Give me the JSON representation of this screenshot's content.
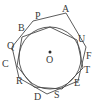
{
  "figure": {
    "type": "geometry-diagram",
    "background_color": "#ffffff",
    "stroke_color": "#4a4a4a",
    "label_color": "#3a3a3a",
    "center": {
      "label": "O",
      "dot": "center-dot",
      "x": 50,
      "y": 58
    },
    "circle": {
      "cx": 50,
      "cy": 58,
      "r": 31
    },
    "inner_polygon": {
      "name": "inscribed-heptagon",
      "points": "50,27 77,40 83,68 62,89 34,87 17,66 22,37"
    },
    "outer_polygon": {
      "name": "circumscribed-heptagon",
      "points": "66,13 86,47 78,81 47,94 19,78 12,47 33,21"
    },
    "labels": [
      {
        "text": "A",
        "x": 62,
        "y": 8
      },
      {
        "text": "P",
        "x": 35,
        "y": 14
      },
      {
        "text": "B",
        "x": 18,
        "y": 26
      },
      {
        "text": "U",
        "x": 78,
        "y": 37
      },
      {
        "text": "Q",
        "x": 8,
        "y": 43
      },
      {
        "text": "F",
        "x": 85,
        "y": 53
      },
      {
        "text": "C",
        "x": 3,
        "y": 61
      },
      {
        "text": "T",
        "x": 83,
        "y": 67
      },
      {
        "text": "R",
        "x": 16,
        "y": 78
      },
      {
        "text": "E",
        "x": 74,
        "y": 80
      },
      {
        "text": "S",
        "x": 54,
        "y": 91
      },
      {
        "text": "D",
        "x": 34,
        "y": 93
      }
    ]
  }
}
